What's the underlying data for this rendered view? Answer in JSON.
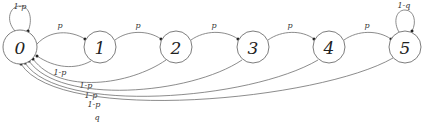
{
  "diagram": {
    "type": "state-transition-diagram",
    "nodes": [
      {
        "id": "0",
        "label": "0",
        "cx": 20,
        "cy": 47,
        "r": 17
      },
      {
        "id": "1",
        "label": "1",
        "cx": 100,
        "cy": 47,
        "r": 16
      },
      {
        "id": "2",
        "label": "2",
        "cx": 176,
        "cy": 47,
        "r": 16
      },
      {
        "id": "3",
        "label": "3",
        "cx": 253,
        "cy": 47,
        "r": 16
      },
      {
        "id": "4",
        "label": "4",
        "cx": 329,
        "cy": 47,
        "r": 16
      },
      {
        "id": "5",
        "label": "5",
        "cx": 405,
        "cy": 47,
        "r": 16
      }
    ],
    "edges": [
      {
        "from": "0",
        "to": "0",
        "label": "1-p",
        "kind": "self-loop"
      },
      {
        "from": "0",
        "to": "1",
        "label": "p",
        "kind": "forward"
      },
      {
        "from": "1",
        "to": "2",
        "label": "p",
        "kind": "forward"
      },
      {
        "from": "2",
        "to": "3",
        "label": "p",
        "kind": "forward"
      },
      {
        "from": "3",
        "to": "4",
        "label": "p",
        "kind": "forward"
      },
      {
        "from": "4",
        "to": "5",
        "label": "p",
        "kind": "forward"
      },
      {
        "from": "5",
        "to": "5",
        "label": "1-q",
        "kind": "self-loop"
      },
      {
        "from": "1",
        "to": "0",
        "label": "1-p",
        "kind": "return"
      },
      {
        "from": "2",
        "to": "0",
        "label": "1-p",
        "kind": "return"
      },
      {
        "from": "3",
        "to": "0",
        "label": "1-p",
        "kind": "return"
      },
      {
        "from": "4",
        "to": "0",
        "label": "1-p",
        "kind": "return"
      },
      {
        "from": "5",
        "to": "0",
        "label": "q",
        "kind": "return"
      }
    ]
  }
}
